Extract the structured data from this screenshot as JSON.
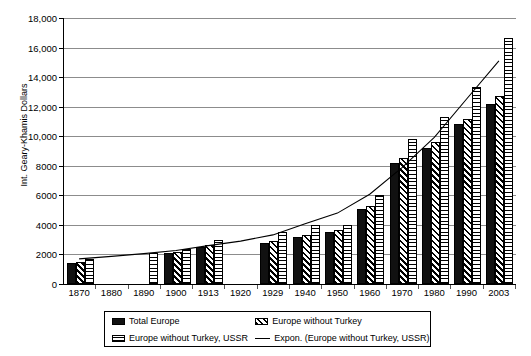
{
  "chart_data": {
    "type": "bar",
    "title": "",
    "xlabel": "",
    "ylabel": "Int. Geary-Khamis Dollars",
    "ylim": [
      0,
      18000
    ],
    "ytick_labels": [
      "0",
      "2000",
      "4000",
      "6000",
      "8000",
      "10,000",
      "12,000",
      "14,000",
      "16,000",
      "18,000"
    ],
    "ytick_values": [
      0,
      2000,
      4000,
      6000,
      8000,
      10000,
      12000,
      14000,
      16000,
      18000
    ],
    "grid": true,
    "legend_position": "bottom",
    "categories": [
      "1870",
      "1880",
      "1890",
      "1900",
      "1913",
      "1920",
      "1929",
      "1940",
      "1950",
      "1960",
      "1970",
      "1980",
      "1990",
      "2003"
    ],
    "series": [
      {
        "name": "Total Europe",
        "pattern": "solid-black",
        "values": [
          1450,
          null,
          null,
          2100,
          2500,
          null,
          2800,
          3200,
          3500,
          5100,
          8200,
          9200,
          10800,
          12200
        ]
      },
      {
        "name": "Europe without Turkey",
        "pattern": "diagonal-hatch",
        "values": [
          1500,
          null,
          null,
          2200,
          2650,
          null,
          2900,
          3300,
          3650,
          5300,
          8500,
          9600,
          11200,
          12700
        ]
      },
      {
        "name": "Europe without Turkey, USSR",
        "pattern": "horizontal-hatch",
        "values": [
          1700,
          null,
          2100,
          2400,
          2950,
          null,
          3500,
          4000,
          4000,
          6000,
          9800,
          11300,
          13300,
          16650
        ]
      },
      {
        "name": "Expon. (Europe without Turkey, USSR)",
        "pattern": "line",
        "type": "trendline",
        "values": [
          1700,
          1870,
          2060,
          2270,
          2600,
          2900,
          3320,
          4080,
          4800,
          6080,
          7880,
          9930,
          12520,
          15100
        ]
      }
    ],
    "legend_entries": [
      "Total Europe",
      "Europe without Turkey",
      "Europe without Turkey, USSR",
      "Expon. (Europe without Turkey, USSR)"
    ]
  }
}
